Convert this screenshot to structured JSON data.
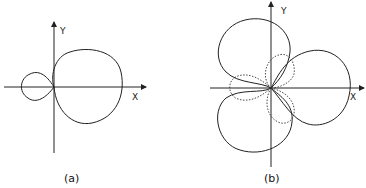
{
  "figure_a": {
    "caption": "(a)",
    "x_label": "X",
    "y_label": "Y",
    "description": "Limaçon with inner loop: large outer loop to the right of origin, small inner loop to the left"
  },
  "figure_b": {
    "caption": "(b)",
    "x_label": "X",
    "y_label": "Y",
    "description": "Three-lobed curve (solid) with three smaller dotted lobes near the origin"
  },
  "colors": {
    "line": "#222222",
    "background": "#ffffff"
  }
}
